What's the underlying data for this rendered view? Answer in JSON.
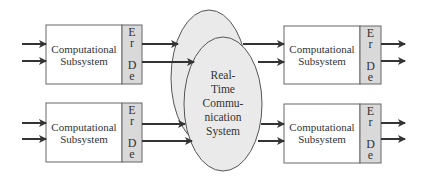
{
  "diagram": {
    "colors": {
      "box_fill": "#ffffff",
      "erde_fill": "#d9d9d9",
      "ellipse_fill": "#eaeaea",
      "stroke": "#555555",
      "arrow": "#333333"
    },
    "subsystems": [
      {
        "id": "top-left",
        "label_line1": "Computational",
        "label_line2": "Subsystem",
        "er1": "E",
        "er2": "r",
        "de1": "D",
        "de2": "e"
      },
      {
        "id": "bottom-left",
        "label_line1": "Computational",
        "label_line2": "Subsystem",
        "er1": "E",
        "er2": "r",
        "de1": "D",
        "de2": "e"
      },
      {
        "id": "top-right",
        "label_line1": "Computational",
        "label_line2": "Subsystem",
        "er1": "E",
        "er2": "r",
        "de1": "D",
        "de2": "e"
      },
      {
        "id": "bottom-right",
        "label_line1": "Computational",
        "label_line2": "Subsystem",
        "er1": "E",
        "er2": "r",
        "de1": "D",
        "de2": "e"
      }
    ],
    "center": {
      "line1": "Real-",
      "line2": "Time",
      "line3": "Commu-",
      "line4": "nication",
      "line5": "System"
    }
  }
}
